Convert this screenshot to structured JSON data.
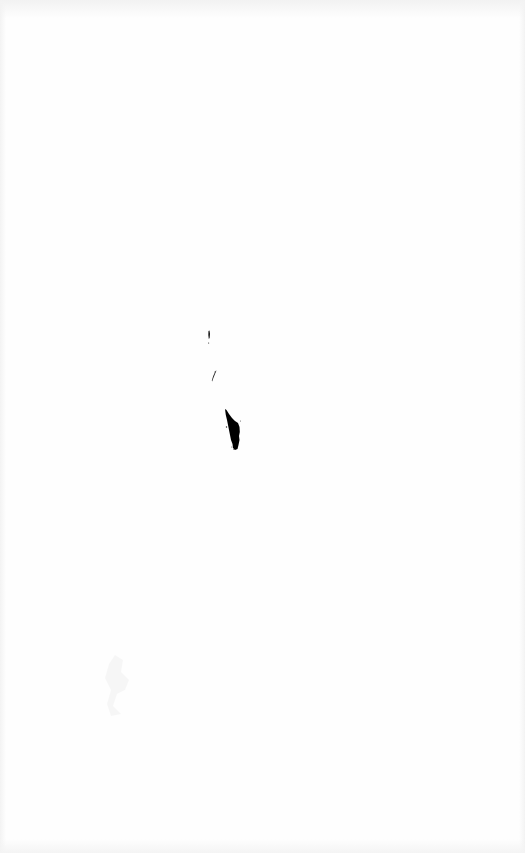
{
  "page": {
    "background": "#ffffff",
    "ink_color": "#000000"
  },
  "map": {
    "features": [
      {
        "name": "small-island-north",
        "type": "islet"
      },
      {
        "name": "small-island-middle",
        "type": "islet"
      },
      {
        "name": "large-island-south",
        "type": "island"
      }
    ],
    "faint_marks": [
      {
        "name": "faded-scan-mark"
      }
    ]
  }
}
